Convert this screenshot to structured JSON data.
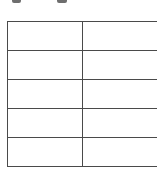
{
  "document": {
    "clipped_text_fragments": [
      {
        "left": 12,
        "width": 9
      },
      {
        "left": 57,
        "width": 10
      }
    ],
    "table": {
      "columns": 2,
      "rows": [
        [
          "",
          ""
        ],
        [
          "",
          ""
        ],
        [
          "",
          ""
        ],
        [
          "",
          ""
        ],
        [
          "",
          ""
        ]
      ],
      "border_color": "#4a4a4a"
    }
  }
}
